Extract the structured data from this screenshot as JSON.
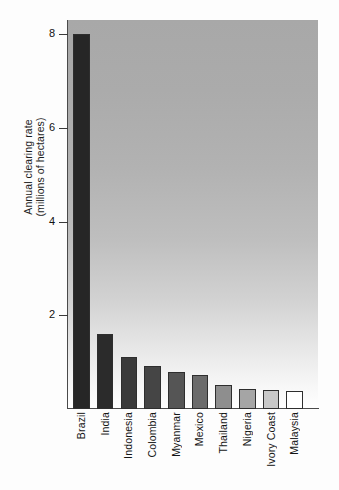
{
  "chart_data": {
    "type": "bar",
    "title": "",
    "subtitle": "",
    "xlabel": "",
    "ylabel": "Annual clearing rate (millions of hectares)",
    "ylabel_line1": "Annual clearing rate",
    "ylabel_line2": "(millions of hectares)",
    "categories": [
      "Brazil",
      "India",
      "Indonesia",
      "Colombia",
      "Myanmar",
      "Mexico",
      "Thailand",
      "Nigeria",
      "Ivory Coast",
      "Malaysia"
    ],
    "values": [
      8.0,
      1.6,
      1.1,
      0.92,
      0.8,
      0.73,
      0.52,
      0.42,
      0.4,
      0.38
    ],
    "ylim": [
      0,
      8.3
    ],
    "yticks": [
      2,
      4,
      6,
      8
    ],
    "ytick_labels": [
      "2",
      "4",
      "6",
      "8"
    ],
    "grid": false,
    "legend": "none",
    "bar_colors": [
      "#262626",
      "#2b2b2b",
      "#3a3a3a",
      "#454545",
      "#555555",
      "#6b6b6b",
      "#8e8e8e",
      "#a5a5a5",
      "#c8c8c8",
      "#ffffff"
    ],
    "plot_background": "gray-vertical-gradient",
    "plot_background_top": "#a8a8a8",
    "plot_background_bottom": "#ffffff",
    "axis_color": "#4a4a4a",
    "bar_outline_color": "#2e2e2e"
  }
}
